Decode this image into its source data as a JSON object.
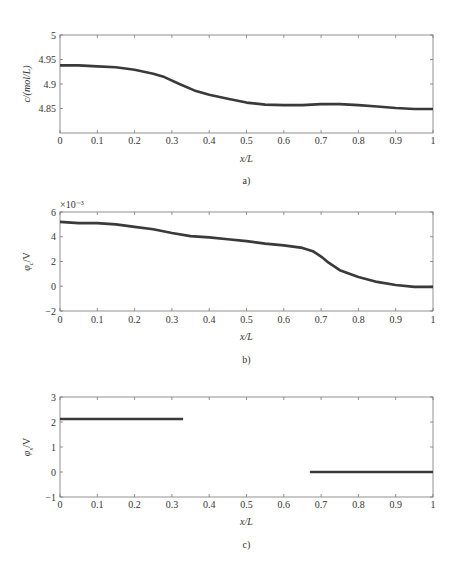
{
  "chart_data": [
    {
      "id": "a",
      "type": "line",
      "caption": "a)",
      "title": "",
      "xlabel": "x/L",
      "ylabel": "c/(mol/L)",
      "xlim": [
        0,
        1
      ],
      "ylim": [
        4.8,
        5
      ],
      "xticks": [
        0,
        0.1,
        0.2,
        0.3,
        0.4,
        0.5,
        0.6,
        0.7,
        0.8,
        0.9,
        1
      ],
      "xtick_labels": [
        "0",
        "0.1",
        "0.2",
        "0.3",
        "0.4",
        "0.5",
        "0.6",
        "0.7",
        "0.8",
        "0.9",
        "1"
      ],
      "yticks": [
        4.85,
        4.9,
        4.95,
        5
      ],
      "ytick_labels": [
        "4.85",
        "4.9",
        "4.95",
        "5"
      ],
      "grid": false,
      "legend": null,
      "series": [
        {
          "name": "c",
          "x": [
            0,
            0.05,
            0.1,
            0.15,
            0.2,
            0.25,
            0.28,
            0.32,
            0.36,
            0.4,
            0.45,
            0.5,
            0.55,
            0.6,
            0.65,
            0.7,
            0.75,
            0.8,
            0.85,
            0.9,
            0.95,
            1
          ],
          "y": [
            4.938,
            4.938,
            4.936,
            4.934,
            4.929,
            4.921,
            4.914,
            4.9,
            4.887,
            4.878,
            4.87,
            4.862,
            4.858,
            4.857,
            4.857,
            4.859,
            4.859,
            4.857,
            4.854,
            4.851,
            4.849,
            4.849
          ]
        }
      ]
    },
    {
      "id": "b",
      "type": "line",
      "caption": "b)",
      "title": "",
      "xlabel": "x/L",
      "ylabel": "φc/V",
      "ylabel_main": "φ",
      "ylabel_sub": "c",
      "ylabel_unit": "/V",
      "y_multiplier": "×10⁻³",
      "xlim": [
        0,
        1
      ],
      "ylim": [
        -2,
        6
      ],
      "xticks": [
        0,
        0.1,
        0.2,
        0.3,
        0.4,
        0.5,
        0.6,
        0.7,
        0.8,
        0.9,
        1
      ],
      "xtick_labels": [
        "0",
        "0.1",
        "0.2",
        "0.3",
        "0.4",
        "0.5",
        "0.6",
        "0.7",
        "0.8",
        "0.9",
        "1"
      ],
      "yticks": [
        -2,
        0,
        2,
        4,
        6
      ],
      "ytick_labels": [
        "−2",
        "0",
        "2",
        "4",
        "6"
      ],
      "grid": false,
      "legend": null,
      "series": [
        {
          "name": "φc",
          "x": [
            0,
            0.05,
            0.1,
            0.15,
            0.2,
            0.25,
            0.3,
            0.35,
            0.4,
            0.45,
            0.5,
            0.55,
            0.6,
            0.65,
            0.68,
            0.7,
            0.72,
            0.75,
            0.8,
            0.85,
            0.9,
            0.95,
            1
          ],
          "y": [
            5.2,
            5.1,
            5.1,
            5.0,
            4.8,
            4.6,
            4.3,
            4.05,
            3.95,
            3.8,
            3.65,
            3.45,
            3.3,
            3.1,
            2.8,
            2.4,
            1.9,
            1.3,
            0.75,
            0.35,
            0.1,
            -0.05,
            -0.05
          ]
        }
      ]
    },
    {
      "id": "c",
      "type": "line",
      "caption": "c)",
      "title": "",
      "xlabel": "x/L",
      "ylabel": "φs/V",
      "ylabel_main": "φ",
      "ylabel_sub": "s",
      "ylabel_unit": "/V",
      "xlim": [
        0,
        1
      ],
      "ylim": [
        -1,
        3
      ],
      "xticks": [
        0,
        0.1,
        0.2,
        0.3,
        0.4,
        0.5,
        0.6,
        0.7,
        0.8,
        0.9,
        1
      ],
      "xtick_labels": [
        "0",
        "0.1",
        "0.2",
        "0.3",
        "0.4",
        "0.5",
        "0.6",
        "0.7",
        "0.8",
        "0.9",
        "1"
      ],
      "yticks": [
        -1,
        0,
        1,
        2,
        3
      ],
      "ytick_labels": [
        "−1",
        "0",
        "1",
        "2",
        "3"
      ],
      "grid": false,
      "legend": null,
      "series": [
        {
          "name": "φs (negative electrode)",
          "x": [
            0,
            0.33
          ],
          "y": [
            2.12,
            2.12
          ]
        },
        {
          "name": "φs (positive electrode)",
          "x": [
            0.67,
            1
          ],
          "y": [
            0,
            0
          ]
        }
      ]
    }
  ],
  "layout": {
    "panels": [
      {
        "left": 60,
        "top": 35,
        "width": 373,
        "height": 98,
        "ticklabel_y": 144,
        "xlabel_y": 162,
        "caption_y": 184
      },
      {
        "left": 60,
        "top": 212,
        "width": 373,
        "height": 99,
        "ticklabel_y": 323,
        "xlabel_y": 340,
        "caption_y": 363
      },
      {
        "left": 60,
        "top": 397,
        "width": 373,
        "height": 100,
        "ticklabel_y": 508,
        "xlabel_y": 525,
        "caption_y": 548
      }
    ],
    "line_color": "#3a3a3a",
    "frame_color": "#777777"
  }
}
